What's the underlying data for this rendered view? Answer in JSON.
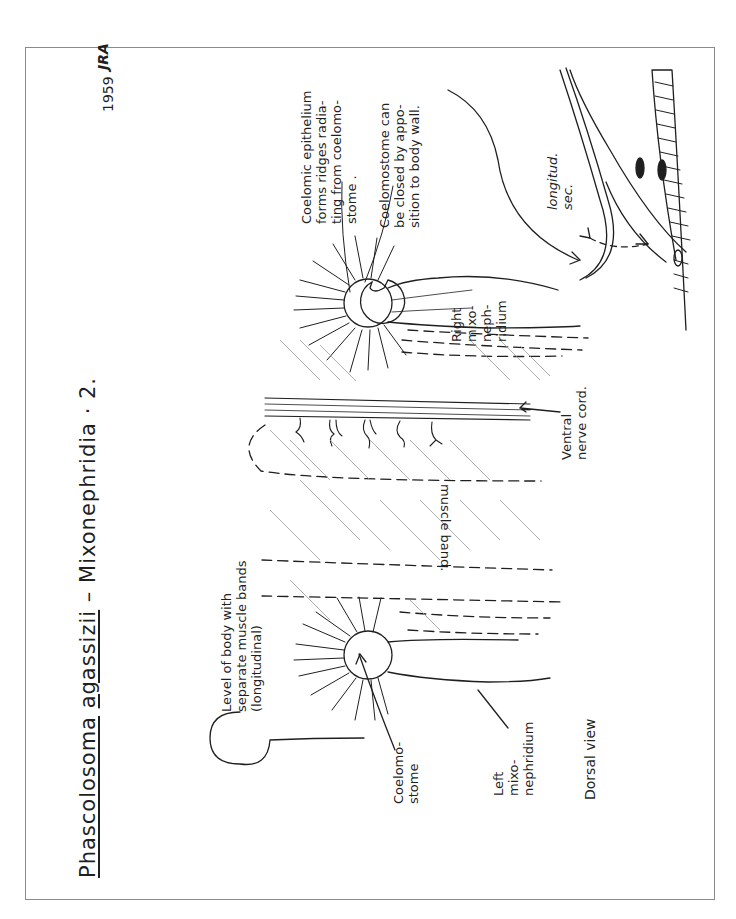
{
  "page": {
    "title": {
      "genus": "Phascolosoma",
      "species": "agassizii",
      "separator": "–",
      "subject": "Mixonephridia · 2."
    },
    "date": "1959",
    "initials": "JRA",
    "view_label": "Dorsal view"
  },
  "labels": {
    "level_of_body": [
      "Level of body with",
      "separate muscle bands",
      "(longitudinal)"
    ],
    "coelomostome": [
      "Coelomo-",
      "stome"
    ],
    "left_mixonephridium": [
      "Left",
      "mixo-",
      "nephridium"
    ],
    "muscle_band": "muscle band.",
    "ventral_nerve_cord": [
      "Ventral",
      "nerve cord."
    ],
    "right_mixonephridium": [
      "Right",
      "mixo-",
      "neph-",
      "ridium"
    ],
    "coelomic_epithelium": [
      "Coelomic epithelium",
      "forms ridges radia-",
      "ting from coelomo-",
      "stome ."
    ],
    "coelomostome_closed": [
      "Coelomostome can",
      "be closed by appo-",
      "sition to body wall."
    ],
    "longitud_sec": [
      "longitud.",
      "sec."
    ]
  },
  "colors": {
    "ink": "#1f1f1f",
    "hatch": "#9a9a9a",
    "frame": "#8a8a8a",
    "paper": "#ffffff"
  }
}
